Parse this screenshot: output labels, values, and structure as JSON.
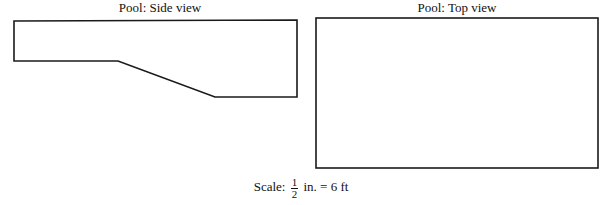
{
  "side_view": {
    "title": "Pool: Side view",
    "outline_points": [
      [
        14,
        21
      ],
      [
        297,
        20
      ],
      [
        297,
        97
      ],
      [
        215,
        97
      ],
      [
        118,
        61
      ],
      [
        14,
        61
      ]
    ]
  },
  "top_view": {
    "title": "Pool: Top view",
    "rect": {
      "x": 316,
      "y": 18,
      "width": 282,
      "height": 150
    }
  },
  "scale": {
    "label": "Scale:",
    "numerator": "1",
    "denominator": "2",
    "suffix": "in. = 6 ft"
  },
  "colors": {
    "stroke": "#1a1a1a",
    "background": "#ffffff"
  }
}
